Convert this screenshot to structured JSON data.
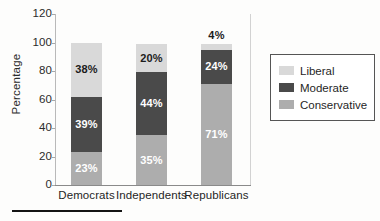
{
  "chart_data": {
    "type": "bar",
    "subtype": "stacked-bar",
    "title": "",
    "xlabel": "",
    "ylabel": "Percentage",
    "ylim": [
      0,
      120
    ],
    "yticks": [
      0,
      20,
      40,
      60,
      80,
      100,
      120
    ],
    "ytick_labels": [
      "0",
      "20",
      "40",
      "60",
      "80",
      "100",
      "120"
    ],
    "grid": false,
    "legend_position": "right",
    "categories": [
      "Democrats",
      "Independents",
      "Republicans"
    ],
    "series": [
      {
        "name": "Liberal",
        "color": "#d9d9d9",
        "values": [
          38,
          20,
          4
        ],
        "labels": [
          "38%",
          "20%",
          "4%"
        ],
        "label_color": "#1c1c1c"
      },
      {
        "name": "Moderate",
        "color": "#4a4a4a",
        "values": [
          39,
          44,
          24
        ],
        "labels": [
          "39%",
          "44%",
          "24%"
        ],
        "label_color": "#ffffff"
      },
      {
        "name": "Conservative",
        "color": "#adadad",
        "values": [
          23,
          35,
          71
        ],
        "labels": [
          "23%",
          "35%",
          "71%"
        ],
        "label_color": "#ffffff"
      }
    ]
  },
  "axis": {
    "y_label": "Percentage",
    "ticks": [
      {
        "value": "120"
      },
      {
        "value": "100"
      },
      {
        "value": "80"
      },
      {
        "value": "60"
      },
      {
        "value": "40"
      },
      {
        "value": "20"
      },
      {
        "value": "0"
      }
    ]
  },
  "bars": [
    {
      "category": "Democrats",
      "segments": [
        {
          "series": "Liberal",
          "label": "38%"
        },
        {
          "series": "Moderate",
          "label": "39%"
        },
        {
          "series": "Conservative",
          "label": "23%"
        }
      ]
    },
    {
      "category": "Independents",
      "segments": [
        {
          "series": "Liberal",
          "label": "20%"
        },
        {
          "series": "Moderate",
          "label": "44%"
        },
        {
          "series": "Conservative",
          "label": "35%"
        }
      ]
    },
    {
      "category": "Republicans",
      "segments": [
        {
          "series": "Liberal",
          "label": "4%"
        },
        {
          "series": "Moderate",
          "label": "24%"
        },
        {
          "series": "Conservative",
          "label": "71%"
        }
      ]
    }
  ],
  "legend": {
    "entries": [
      {
        "label": "Liberal",
        "color": "#d9d9d9"
      },
      {
        "label": "Moderate",
        "color": "#4a4a4a"
      },
      {
        "label": "Conservative",
        "color": "#adadad"
      }
    ]
  }
}
